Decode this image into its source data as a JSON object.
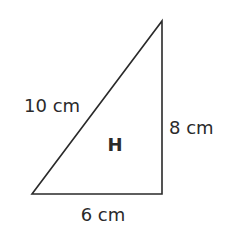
{
  "figure": {
    "shape": "right triangle",
    "label": "H",
    "hypotenuse_label": "10 cm",
    "height_label": "8 cm",
    "base_label": "6 cm",
    "stroke_color": "#2a2a2a",
    "background": "#ffffff"
  }
}
